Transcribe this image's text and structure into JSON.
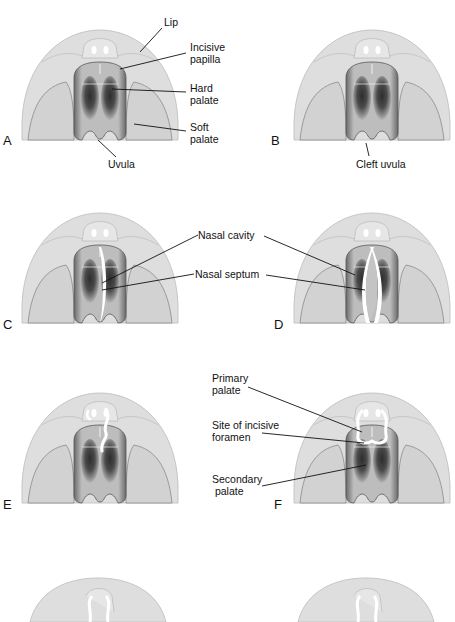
{
  "figure": {
    "panels": [
      {
        "letter": "A",
        "labels": [
          "Lip",
          "Incisive\npapilla",
          "Hard\npalate",
          "Soft\npalate",
          "Uvula"
        ]
      },
      {
        "letter": "B",
        "labels": [
          "Cleft uvula"
        ]
      },
      {
        "letter": "C",
        "labels": []
      },
      {
        "letter": "D",
        "labels": []
      },
      {
        "letter": "E",
        "labels": []
      },
      {
        "letter": "F",
        "labels": []
      }
    ],
    "shared_labels": {
      "nasal_cavity": "Nasal cavity",
      "nasal_septum": "Nasal septum",
      "primary_palate": "Primary\npalate",
      "incisive_foramen": "Site of incisive\nforamen",
      "secondary_palate": "Secondary\n palate"
    },
    "colors": {
      "head": "#dcdcdc",
      "head_outline": "#b8b8b8",
      "palate_dark": "#3a3a3a",
      "palate_light": "#c9c9c9",
      "leader_line": "#111111",
      "cleft": "#ffffff"
    }
  }
}
